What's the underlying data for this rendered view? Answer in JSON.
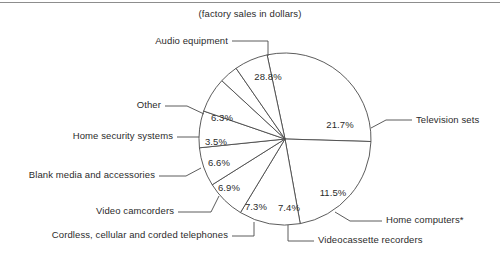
{
  "chart_data": {
    "type": "pie",
    "title": "(factory sales in dollars)",
    "subtitle": "",
    "xlabel": "",
    "ylabel": "",
    "legend_position": "labels-with-leader-lines",
    "grid": false,
    "units": "percent",
    "categories": [
      "Audio equipment",
      "Television sets",
      "Home computers*",
      "Videocassette recorders",
      "Cordless, cellular and corded telephones",
      "Video camcorders",
      "Blank media and accessories",
      "Home security systems",
      "Other"
    ],
    "values": [
      28.8,
      21.7,
      11.5,
      7.4,
      7.3,
      6.9,
      6.6,
      3.5,
      6.3
    ],
    "value_labels": [
      "28.8%",
      "21.7%",
      "11.5%",
      "7.4%",
      "7.3%",
      "6.9%",
      "6.6%",
      "3.5%",
      "6.3%"
    ],
    "slices": [
      {
        "label": "Audio equipment",
        "value": 28.8,
        "value_label": "28.8%",
        "label_side": "top"
      },
      {
        "label": "Television sets",
        "value": 21.7,
        "value_label": "21.7%",
        "label_side": "right"
      },
      {
        "label": "Home computers*",
        "value": 11.5,
        "value_label": "11.5%",
        "label_side": "right"
      },
      {
        "label": "Videocassette recorders",
        "value": 7.4,
        "value_label": "7.4%",
        "label_side": "bottom"
      },
      {
        "label": "Cordless, cellular and corded telephones",
        "value": 7.3,
        "value_label": "7.3%",
        "label_side": "left"
      },
      {
        "label": "Video camcorders",
        "value": 6.9,
        "value_label": "6.9%",
        "label_side": "left"
      },
      {
        "label": "Blank media and accessories",
        "value": 6.6,
        "value_label": "6.6%",
        "label_side": "left"
      },
      {
        "label": "Home security systems",
        "value": 3.5,
        "value_label": "3.5%",
        "label_side": "left"
      },
      {
        "label": "Other",
        "value": 6.3,
        "value_label": "6.3%",
        "label_side": "left"
      }
    ]
  },
  "title": {
    "text": "(factory sales in dollars)"
  },
  "pct": {
    "audio": "28.8%",
    "television": "21.7%",
    "computers": "11.5%",
    "vcr": "7.4%",
    "phones": "7.3%",
    "camcorders": "6.9%",
    "blank_media": "6.6%",
    "security": "3.5%",
    "other": "6.3%"
  },
  "labels": {
    "audio": "Audio equipment",
    "television": "Television sets",
    "computers": "Home computers*",
    "vcr": "Videocassette recorders",
    "phones": "Cordless, cellular and corded telephones",
    "camcorders": "Video camcorders",
    "blank_media": "Blank media and accessories",
    "security": "Home security systems",
    "other": "Other"
  },
  "colors": {
    "stroke": "#4a4a4a",
    "text": "#2b2b2b",
    "background": "#ffffff",
    "rule": "#8d8d8d"
  }
}
